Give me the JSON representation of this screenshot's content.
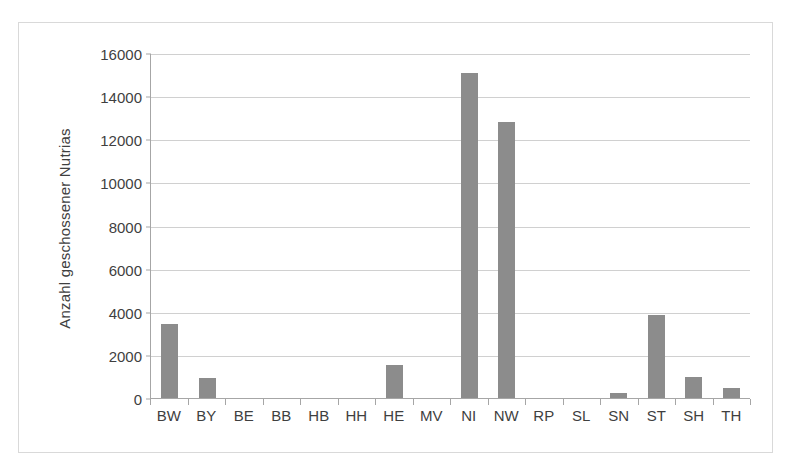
{
  "chart_data": {
    "type": "bar",
    "title": "",
    "subtitle": "",
    "xlabel": "",
    "ylabel": "Anzahl geschossener Nutrias",
    "categories": [
      "BW",
      "BY",
      "BE",
      "BB",
      "HB",
      "HH",
      "HE",
      "MV",
      "NI",
      "NW",
      "RP",
      "SL",
      "SN",
      "ST",
      "SH",
      "TH"
    ],
    "values": [
      3450,
      920,
      0,
      0,
      0,
      0,
      1550,
      0,
      15050,
      12780,
      0,
      0,
      220,
      3840,
      980,
      480
    ],
    "ylim": [
      0,
      16000
    ],
    "yticks": [
      0,
      2000,
      4000,
      6000,
      8000,
      10000,
      12000,
      14000,
      16000
    ],
    "ytick_labels": [
      "0",
      "2000",
      "4000",
      "6000",
      "8000",
      "10000",
      "12000",
      "14000",
      "16000"
    ],
    "grid": true,
    "legend": false,
    "legend_position": "none",
    "bar_color": "#8c8c8c",
    "gridline_color": "#d0d0d0",
    "axis_color": "#a6a6a6",
    "frame_color": "#d9d9d9",
    "text_color": "#3f3f3f"
  }
}
